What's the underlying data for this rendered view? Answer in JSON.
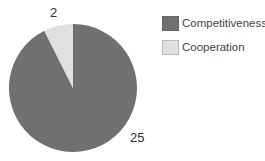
{
  "chart_data": {
    "type": "pie",
    "title": "",
    "categories": [
      "Competitiveness",
      "Cooperation"
    ],
    "values": [
      25,
      2
    ],
    "colors": [
      "#707070",
      "#e0e0e0"
    ],
    "data_labels": [
      "25",
      "2"
    ],
    "start_angle_note": "Cooperation slice sits just counter-clockwise of 12 o'clock",
    "legend": {
      "position": "right",
      "entries": [
        "Competitiveness",
        "Cooperation"
      ]
    }
  },
  "labels": {
    "competitiveness_value": "25",
    "cooperation_value": "2"
  },
  "legend": {
    "items": [
      {
        "label": "Competitiveness",
        "color": "#707070"
      },
      {
        "label": "Cooperation",
        "color": "#e0e0e0"
      }
    ]
  }
}
